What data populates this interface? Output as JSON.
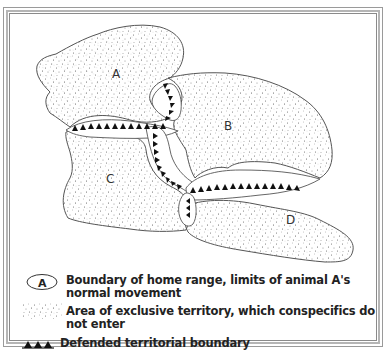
{
  "diagram": {
    "type": "territory-map",
    "regions": [
      {
        "label": "A",
        "name": "home-range-a"
      },
      {
        "label": "B",
        "name": "home-range-b"
      },
      {
        "label": "C",
        "name": "home-range-c"
      },
      {
        "label": "D",
        "name": "home-range-d"
      }
    ],
    "colors": {
      "outline": "#555555",
      "stipple": "#6a6a6a",
      "defended_triangle": "#111111",
      "frame": "#a8a8a8"
    }
  },
  "legend": {
    "items": [
      {
        "key_label": "A",
        "key_icon": "oval-boundary-icon",
        "text": "Boundary of home range, limits of animal A's normal movement"
      },
      {
        "key_icon": "stipple-area-icon",
        "text": "Area of exclusive territory, which conspecifics do not enter"
      },
      {
        "key_icon": "triangle-boundary-icon",
        "text": "Defended territorial boundary"
      }
    ]
  }
}
